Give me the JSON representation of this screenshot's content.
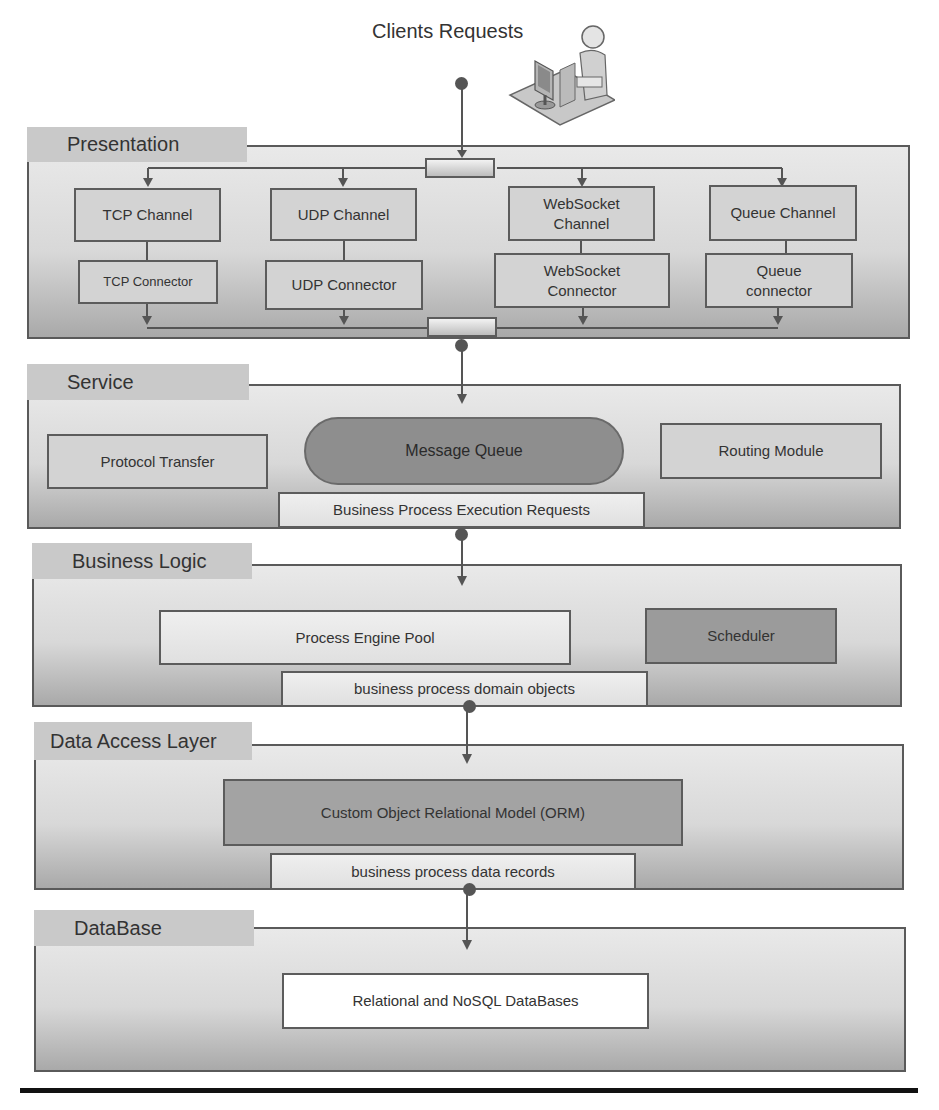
{
  "diagram": {
    "title": "Clients Requests",
    "client_icon": "user-at-computer-icon",
    "layers": [
      {
        "name": "Presentation",
        "channels": [
          {
            "channel": "TCP Channel",
            "connector": "TCP Connector"
          },
          {
            "channel": "UDP Channel",
            "connector": "UDP Connector"
          },
          {
            "channel": "WebSocket Channel",
            "connector": "WebSocket Connector"
          },
          {
            "channel": "Queue Channel",
            "connector": "Queue connector"
          }
        ]
      },
      {
        "name": "Service",
        "components": [
          "Protocol Transfer",
          "Message Queue",
          "Routing Module"
        ],
        "output": "Business Process Execution Requests"
      },
      {
        "name": "Business Logic",
        "components": [
          "Process Engine Pool",
          "Scheduler"
        ],
        "output": "business process domain objects"
      },
      {
        "name": "Data Access Layer",
        "components": [
          "Custom Object Relational Model (ORM)"
        ],
        "output": "business process data records"
      },
      {
        "name": "DataBase",
        "components": [
          "Relational and NoSQL DataBases"
        ]
      }
    ],
    "ws_channel_lines": [
      "WebSocket",
      "Channel"
    ],
    "ws_connector_lines": [
      "WebSocket",
      "Connector"
    ],
    "queue_connector_lines": [
      "Queue",
      "connector"
    ],
    "colors": {
      "layer_border": "#5a5a5a",
      "layer_tab": "#c9c9c9",
      "box_fill": "#d3d3d3",
      "dark_fill": "#9b9b9b",
      "pill_fill": "#8e8e8e",
      "arrow": "#555555"
    }
  }
}
